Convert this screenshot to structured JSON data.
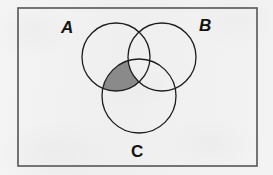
{
  "figure": {
    "kind": "venn-diagram",
    "background_color": "#f1f1f1",
    "border": {
      "name": "universal-set-rectangle",
      "x": 18,
      "y": 8,
      "width": 239,
      "height": 158,
      "stroke_color": "#555555",
      "stroke_width": 1.6,
      "fill": "none"
    },
    "circles": [
      {
        "id": "circle-a",
        "set": "A",
        "cx": 116,
        "cy": 57,
        "r": 34,
        "stroke_color": "#1e1e1e",
        "stroke_width": 1.3,
        "fill": "none"
      },
      {
        "id": "circle-b",
        "set": "B",
        "cx": 162,
        "cy": 57,
        "r": 34,
        "stroke_color": "#1e1e1e",
        "stroke_width": 1.3,
        "fill": "none"
      },
      {
        "id": "circle-c",
        "set": "C",
        "cx": 139,
        "cy": 96,
        "r": 37,
        "stroke_color": "#1e1e1e",
        "stroke_width": 1.3,
        "fill": "none"
      }
    ],
    "shaded_region": {
      "id": "shaded-region",
      "description": "(A intersect C) minus B",
      "expression": "(A ∩ C) \\ B",
      "fill_color": "#8a8a8a",
      "included_sets": [
        "A",
        "C"
      ],
      "excluded_sets": [
        "B"
      ]
    },
    "labels": {
      "a": "A",
      "b": "B",
      "c": "C"
    },
    "label_positions": {
      "a": {
        "x": 61,
        "y": 19,
        "italic": true
      },
      "b": {
        "x": 199,
        "y": 17,
        "italic": true
      },
      "c": {
        "x": 131,
        "y": 143,
        "italic": false
      }
    }
  }
}
